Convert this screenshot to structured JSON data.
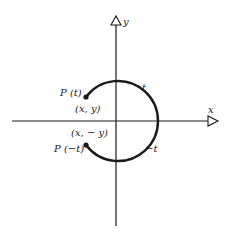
{
  "diagram": {
    "axes": {
      "x_label": "x",
      "y_label": "y"
    },
    "arc_labels": {
      "upper": "t",
      "lower": "−t"
    },
    "points": [
      {
        "name": "P (t)",
        "coord": "(x, y)"
      },
      {
        "name": "P (−t)",
        "coord": "(x, − y)"
      }
    ],
    "colors": {
      "stroke": "#1a1a1a",
      "background": "#ffffff"
    }
  }
}
